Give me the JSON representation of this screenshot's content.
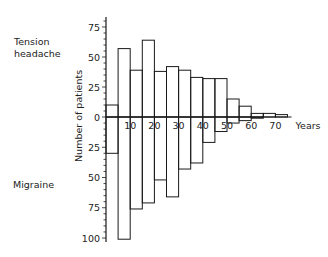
{
  "chart_data": {
    "type": "bar",
    "subtype": "back-to-back histogram",
    "title": "",
    "xlabel": "Years",
    "ylabel": "Number of patients",
    "x_ticks": [
      "10",
      "20",
      "30",
      "40",
      "50",
      "60",
      "70"
    ],
    "y_ticks_upper": [
      "0",
      "25",
      "50",
      "75"
    ],
    "y_ticks_lower": [
      "25",
      "50",
      "75",
      "100"
    ],
    "bin_width_years": 5,
    "bins_start": [
      0,
      5,
      10,
      15,
      20,
      25,
      30,
      35,
      40,
      45,
      50,
      55,
      60,
      65,
      70
    ],
    "series": [
      {
        "name": "Tension headache",
        "direction": "up",
        "values": [
          10,
          57,
          39,
          64,
          38,
          42,
          39,
          33,
          32,
          32,
          15,
          9,
          3,
          3,
          2
        ]
      },
      {
        "name": "Migraine",
        "direction": "down",
        "values": [
          30,
          101,
          76,
          71,
          52,
          66,
          43,
          38,
          21,
          12,
          5,
          3,
          1,
          0,
          0
        ]
      }
    ],
    "ylim_upper": [
      0,
      80
    ],
    "ylim_lower": [
      0,
      100
    ],
    "grid": false,
    "legend": "text labels on left"
  },
  "labels": {
    "tension_line1": "Tension",
    "tension_line2": "headache",
    "migraine": "Migraine",
    "ylabel": "Number of patients",
    "xunit": "Years"
  }
}
